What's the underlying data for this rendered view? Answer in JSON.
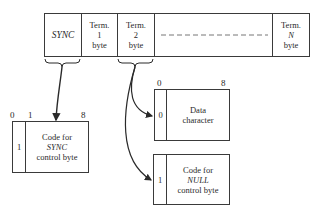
{
  "frame": {
    "cells": [
      {
        "id": "sync",
        "lines": [
          "SYNC"
        ],
        "italic_line": 0
      },
      {
        "id": "term1",
        "lines": [
          "Term.",
          "1",
          "byte"
        ]
      },
      {
        "id": "term2",
        "lines": [
          "Term.",
          "2",
          "byte"
        ]
      },
      {
        "id": "gap",
        "lines": []
      },
      {
        "id": "termN",
        "lines": [
          "Term.",
          "N",
          "byte"
        ],
        "italic_line": 1
      }
    ]
  },
  "sync_box": {
    "bit_labels": {
      "start": "0",
      "second": "1",
      "end": "8"
    },
    "flag_bit": "1",
    "lines": [
      "Code for",
      "SYNC",
      "control byte"
    ]
  },
  "data_box": {
    "bit_labels": {
      "start": "0",
      "end": "8"
    },
    "flag_bit": "0",
    "lines": [
      "Data",
      "character"
    ]
  },
  "null_box": {
    "flag_bit": "1",
    "lines": [
      "Code for",
      "NULL",
      "control byte"
    ]
  },
  "colors": {
    "line": "#3a3a3a",
    "background": "#ffffff"
  }
}
